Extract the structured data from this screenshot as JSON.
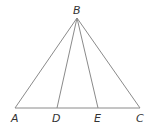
{
  "diagram": {
    "type": "triangle-with-cevians",
    "points": {
      "A": {
        "label": "A",
        "x": 15,
        "y": 108
      },
      "B": {
        "label": "B",
        "x": 77,
        "y": 18
      },
      "C": {
        "label": "C",
        "x": 140,
        "y": 108
      },
      "D": {
        "label": "D",
        "x": 57,
        "y": 108
      },
      "E": {
        "label": "E",
        "x": 98,
        "y": 108
      }
    },
    "segments": [
      "AB",
      "BC",
      "AC",
      "BD",
      "BE"
    ],
    "colors": {
      "stroke": "#8a8a8a",
      "label": "#333333",
      "background": "#ffffff"
    }
  }
}
